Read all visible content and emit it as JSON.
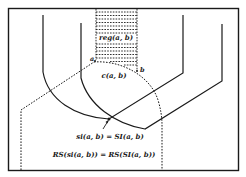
{
  "figure": {
    "labels": {
      "region": "reg(a, b)",
      "curve": "c(a, b)",
      "point_a": "a",
      "point_b": "b",
      "equation_1": "si(a, b) = SI(a, b)",
      "equation_2": "RS(si(a, b)) = RS(SI(a, b))"
    },
    "colors": {
      "stroke": "#1a1a1a",
      "background": "#ffffff"
    }
  }
}
